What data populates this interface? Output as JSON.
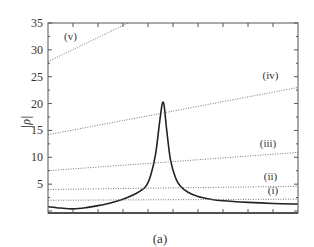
{
  "chart_data": {
    "type": "line",
    "title": "",
    "caption": "(a)",
    "xlabel": "",
    "ylabel": "|ρ|",
    "ylim": [
      0,
      35
    ],
    "xlim": [
      0,
      10
    ],
    "yticks": [
      5,
      10,
      15,
      20,
      25,
      30,
      35
    ],
    "ytick_labels": [
      "5",
      "10",
      "15",
      "20",
      "25",
      "30",
      "35"
    ],
    "xticks_count": 10,
    "xtick_labels": [],
    "grid": false,
    "legend": "none",
    "colors": {
      "curve": "#222222",
      "dotted": "#777777",
      "frame": "#555555",
      "text": "#333333"
    },
    "series": [
      {
        "name": "|ρ| resonance curve",
        "style": "solid",
        "x": [
          0,
          0.5,
          1,
          1.5,
          2,
          2.5,
          3,
          3.5,
          3.9,
          4.1,
          4.3,
          4.45,
          4.55,
          4.6,
          4.65,
          4.75,
          4.9,
          5.1,
          5.3,
          5.6,
          6,
          6.5,
          7,
          8,
          9,
          10
        ],
        "y": [
          0.8,
          0.55,
          0.4,
          0.6,
          1.0,
          1.5,
          2.2,
          3.2,
          4.5,
          6.5,
          10.5,
          16.0,
          19.5,
          20.3,
          19.5,
          15.0,
          9.5,
          6.2,
          4.6,
          3.5,
          2.7,
          2.2,
          1.9,
          1.6,
          1.4,
          1.3
        ]
      },
      {
        "name": "(i)",
        "style": "dotted",
        "x": [
          0,
          10
        ],
        "y": [
          2.0,
          2.2
        ]
      },
      {
        "name": "(ii)",
        "style": "dotted",
        "x": [
          0,
          10
        ],
        "y": [
          4.0,
          4.6
        ]
      },
      {
        "name": "(iii)",
        "style": "dotted",
        "x": [
          0,
          10
        ],
        "y": [
          7.5,
          10.9
        ]
      },
      {
        "name": "(iv)",
        "style": "dotted",
        "x": [
          0,
          10
        ],
        "y": [
          14.2,
          23.0
        ]
      },
      {
        "name": "(v)",
        "style": "dotted",
        "x": [
          0,
          3.2
        ],
        "y": [
          27.8,
          35.0
        ]
      }
    ],
    "annotations": [
      {
        "text": "(v)",
        "x": 0.9,
        "y": 31.8
      },
      {
        "text": "(iv)",
        "x": 8.9,
        "y": 24.5
      },
      {
        "text": "(iii)",
        "x": 8.8,
        "y": 12.0
      },
      {
        "text": "(ii)",
        "x": 8.9,
        "y": 5.7
      },
      {
        "text": "(i)",
        "x": 9.0,
        "y": 3.1
      }
    ]
  },
  "labels": {
    "ylabel": "|ρ|",
    "caption": "(a)"
  }
}
